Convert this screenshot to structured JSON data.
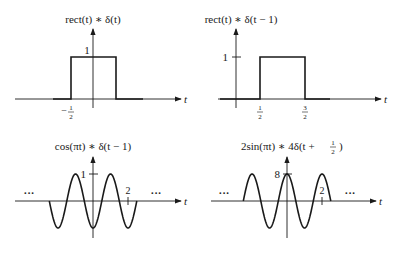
{
  "chart_data": [
    {
      "type": "line",
      "title": "rect(t) * δ(t)",
      "xlabel": "t",
      "ylabel": "",
      "x": [
        -1.3,
        -0.5,
        -0.5,
        0.5,
        0.5,
        1.3
      ],
      "values": [
        0,
        0,
        1,
        1,
        0,
        0
      ],
      "tick_labels": {
        "x": [
          "−1/2"
        ],
        "y": [
          "1"
        ]
      },
      "grid": false
    },
    {
      "type": "line",
      "title": "rect(t) * δ(t − 1)",
      "xlabel": "t",
      "ylabel": "",
      "x": [
        -0.7,
        0.5,
        0.5,
        1.5,
        1.5,
        2.4
      ],
      "values": [
        0,
        0,
        1,
        1,
        0,
        0
      ],
      "tick_labels": {
        "x": [
          "1/2",
          "3/2"
        ],
        "y": [
          "1"
        ]
      },
      "grid": false
    },
    {
      "type": "line",
      "title": "cos(πt) * δ(t − 1)",
      "xlabel": "t",
      "ylabel": "",
      "function": "cos(π(t − 1))",
      "x_range": [
        -2.5,
        2.5
      ],
      "y_range": [
        -1,
        1
      ],
      "tick_labels": {
        "x": [
          "2"
        ],
        "y": [
          "1"
        ]
      },
      "annotations": [
        "...",
        "..."
      ],
      "grid": false
    },
    {
      "type": "line",
      "title": "2sin(πt) * 4δ(t + 1/2)",
      "xlabel": "t",
      "ylabel": "",
      "function": "8cos(πt)",
      "x_range": [
        -2.5,
        2.5
      ],
      "y_range": [
        -8,
        8
      ],
      "tick_labels": {
        "x": [
          "2"
        ],
        "y": [
          "8"
        ]
      },
      "annotations": [
        "...",
        "..."
      ],
      "grid": false
    }
  ],
  "panels": {
    "p1": {
      "title": "rect(t) ∗ δ(t)",
      "axis": "t",
      "y_tick": "1",
      "x_tick_num": "1",
      "x_tick_den": "2",
      "x_tick_sign": "−"
    },
    "p2": {
      "title": "rect(t) ∗ δ(t − 1)",
      "axis": "t",
      "y_tick": "1",
      "x_tick1_num": "1",
      "x_tick1_den": "2",
      "x_tick2_num": "3",
      "x_tick2_den": "2"
    },
    "p3": {
      "title": "cos(πt) ∗ δ(t − 1)",
      "axis": "t",
      "y_tick": "1",
      "x_tick": "2",
      "ellipsis_left": "···",
      "ellipsis_right": "···"
    },
    "p4": {
      "title_main": "2sin(πt) ∗ 4δ(t + ",
      "title_num": "1",
      "title_den": "2",
      "title_close": ")",
      "axis": "t",
      "y_tick": "8",
      "x_tick": "2",
      "ellipsis_left": "···",
      "ellipsis_right": "···"
    }
  }
}
